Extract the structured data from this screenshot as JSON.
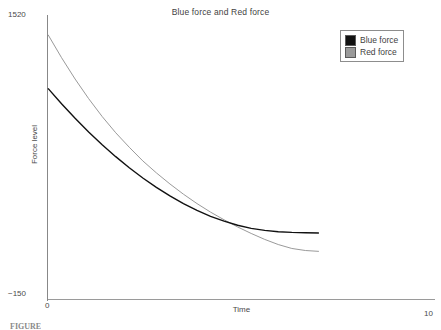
{
  "figure": {
    "caption": "FIGURE"
  },
  "legend": {
    "position": "top-right",
    "entries": [
      {
        "label": "Blue force",
        "color": "#111111"
      },
      {
        "label": "Red force",
        "color": "#9a9a9a"
      }
    ]
  },
  "axes": {
    "y_tick_top": "1520",
    "y_tick_bottom": "−150",
    "x_tick_left": "0",
    "x_tick_right": "10",
    "x_title": "Time",
    "y_title": "Force level"
  },
  "chart_data": {
    "type": "line",
    "title": "Blue force and Red force",
    "xlabel": "Time",
    "ylabel": "Force level",
    "xlim": [
      0,
      10
    ],
    "ylim": [
      -150,
      1520
    ],
    "xticks": [
      0,
      10
    ],
    "yticks": [
      -150,
      1520
    ],
    "grid": false,
    "legend_position": "top-right",
    "x": [
      0.0,
      0.35,
      0.7,
      1.05,
      1.4,
      1.75,
      2.1,
      2.45,
      2.8,
      3.15,
      3.5,
      3.85,
      4.2,
      4.55,
      4.9,
      5.25,
      5.6,
      5.95,
      6.3,
      6.65,
      7.0
    ],
    "series": [
      {
        "name": "Blue force",
        "color": "#111111",
        "values": [
          1090,
          1000,
          915,
          835,
          760,
          690,
          625,
          565,
          510,
          460,
          415,
          375,
          340,
          312,
          288,
          270,
          258,
          250,
          246,
          244,
          243
        ]
      },
      {
        "name": "Red force",
        "color": "#9a9a9a",
        "values": [
          1405,
          1270,
          1145,
          1030,
          925,
          830,
          745,
          665,
          595,
          530,
          470,
          415,
          365,
          320,
          278,
          240,
          205,
          175,
          152,
          140,
          135
        ]
      }
    ],
    "annotations": [
      "Curves cross at approximately t = 4.6",
      "Both series plotted only over t = 0 to t ≈ 7; axis extends to 10"
    ]
  }
}
